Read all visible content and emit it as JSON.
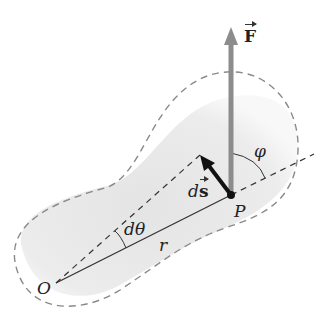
{
  "figure": {
    "labels": {
      "force": "F",
      "displacement_prefix": "d",
      "displacement": "s",
      "point": "P",
      "origin": "O",
      "angle_dtheta": "dθ",
      "radius": "r",
      "angle_phi": "φ"
    },
    "colors": {
      "body_fill": "#e6e6e6",
      "dashed_outline": "#8a8a8a",
      "force_arrow": "#8c8c8c",
      "displacement_arrow": "#111111",
      "lines": "#333333"
    }
  }
}
